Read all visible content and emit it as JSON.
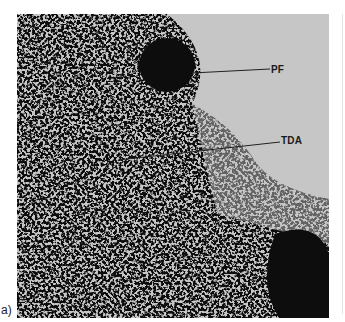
{
  "figure": {
    "panel_label": "a)",
    "image_description": "Histological micrograph, grayscale, dense stained tissue",
    "annotations": [
      {
        "label": "PF",
        "line_from": [
          192,
          73
        ],
        "line_to": [
          270,
          69
        ],
        "text_pos": [
          271,
          64
        ]
      },
      {
        "label": "TDA",
        "line_from": [
          118,
          160
        ],
        "line_to": [
          280,
          142
        ],
        "text_pos": [
          281,
          135
        ]
      }
    ],
    "colors": {
      "background": "#c6c6c6",
      "tissue": "#111111",
      "page": "#ffffff"
    }
  }
}
